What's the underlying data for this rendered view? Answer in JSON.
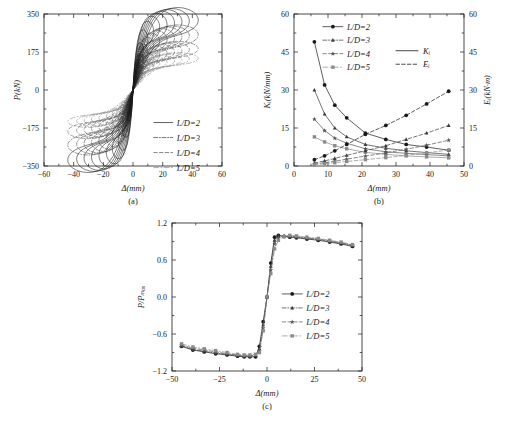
{
  "figure": {
    "background": "#ffffff",
    "ink": "#1a1a1a"
  },
  "subplots": [
    {
      "id": "a",
      "caption": "(a)"
    },
    {
      "id": "b",
      "caption": "(b)"
    },
    {
      "id": "c",
      "caption": "(c)"
    }
  ],
  "series_styles": {
    "ld2": {
      "label": "L/D=2",
      "dash": "none",
      "marker": "circle-filled",
      "color": "#1a1a1a"
    },
    "ld3": {
      "label": "L/D=3",
      "dash": "dashdot",
      "marker": "triangle",
      "color": "#3a3a3a"
    },
    "ld4": {
      "label": "L/D=4",
      "dash": "dashed",
      "marker": "star",
      "color": "#555555"
    },
    "ld5": {
      "label": "L/D=5",
      "dash": "longdash",
      "marker": "square",
      "color": "#8a8a8a"
    }
  },
  "chart_data": [
    {
      "type": "line",
      "id": "a",
      "title": "",
      "xlabel": "Δ(mm)",
      "ylabel": "P(kN)",
      "xlim": [
        -60,
        60
      ],
      "ylim": [
        -350,
        350
      ],
      "xticks": [
        -60,
        -40,
        -20,
        0,
        20,
        40,
        60
      ],
      "yticks": [
        -350,
        -175,
        0,
        175,
        350
      ],
      "grid": false,
      "legend_position": "lower-right",
      "legend": [
        "L/D=2",
        "L/D=3",
        "L/D=4",
        "L/D=5"
      ],
      "description": "Hysteresis (load-displacement) loops; nested cycles of growing amplitude, pinched S-shape.",
      "hysteresis_loops": {
        "ld2": {
          "peak_disp": [
            4,
            7,
            10,
            14,
            18,
            23,
            28,
            33,
            38,
            44
          ],
          "peak_load": [
            120,
            185,
            235,
            268,
            288,
            300,
            308,
            314,
            318,
            322
          ]
        },
        "ld3": {
          "peak_disp": [
            4,
            7,
            10,
            14,
            18,
            23,
            28,
            33,
            38,
            44
          ],
          "peak_load": [
            90,
            140,
            178,
            205,
            222,
            232,
            240,
            246,
            250,
            254
          ]
        },
        "ld4": {
          "peak_disp": [
            4,
            7,
            10,
            14,
            18,
            23,
            28,
            33,
            38,
            44
          ],
          "peak_load": [
            62,
            96,
            124,
            145,
            160,
            170,
            177,
            182,
            186,
            190
          ]
        },
        "ld5": {
          "peak_disp": [
            4,
            7,
            10,
            14,
            18,
            23,
            28,
            33,
            38,
            44
          ],
          "peak_load": [
            45,
            70,
            92,
            108,
            120,
            128,
            134,
            139,
            143,
            146
          ]
        }
      }
    },
    {
      "type": "line",
      "id": "b",
      "title": "",
      "xlabel": "Δ(mm)",
      "ylabel_left": "Kᵢ(kN/mm)",
      "ylabel_right": "Eᵢ(kN·m)",
      "xlim": [
        0,
        50
      ],
      "ylim_left": [
        0,
        60
      ],
      "ylim_right": [
        0,
        60
      ],
      "xticks": [
        0,
        10,
        20,
        30,
        40,
        50
      ],
      "yticks_left": [
        0,
        15,
        30,
        45,
        60
      ],
      "yticks_right": [
        0,
        15,
        30,
        45,
        60
      ],
      "grid": false,
      "legend_position": "upper-left",
      "legend": [
        "L/D=2",
        "L/D=3",
        "L/D=4",
        "L/D=5"
      ],
      "style_legend": [
        {
          "label": "Kᵢ",
          "dash": "solid"
        },
        {
          "label": "Eᵢ",
          "dash": "dashed"
        }
      ],
      "x": [
        6,
        9,
        12,
        15.5,
        21,
        27,
        33,
        39,
        45.5
      ],
      "series": [
        {
          "name": "K_i L/D=2",
          "group": "Ki",
          "style": "ld2",
          "dash": "solid",
          "values": [
            49,
            32,
            24,
            19,
            13,
            10.5,
            8.5,
            7.5,
            6.2
          ]
        },
        {
          "name": "K_i L/D=3",
          "group": "Ki",
          "style": "ld3",
          "dash": "solid",
          "values": [
            30,
            20.5,
            15,
            11.5,
            8.5,
            7,
            6,
            5.3,
            4.6
          ]
        },
        {
          "name": "K_i L/D=4",
          "group": "Ki",
          "style": "ld4",
          "dash": "solid",
          "values": [
            18.5,
            14,
            11,
            9,
            6.8,
            5.6,
            5,
            4.5,
            4
          ]
        },
        {
          "name": "K_i L/D=5",
          "group": "Ki",
          "style": "ld5",
          "dash": "solid",
          "values": [
            11.5,
            9.5,
            8,
            6.8,
            5.4,
            4.6,
            4,
            3.6,
            3.2
          ]
        },
        {
          "name": "E_i L/D=2",
          "group": "Ei",
          "style": "ld2",
          "dash": "dashed",
          "values": [
            2.5,
            4,
            6,
            8.5,
            12.5,
            16,
            20,
            24.5,
            29.5
          ]
        },
        {
          "name": "E_i L/D=3",
          "group": "Ei",
          "style": "ld3",
          "dash": "dashed",
          "values": [
            1.2,
            2,
            3,
            4.2,
            6,
            8,
            10.5,
            13,
            16
          ]
        },
        {
          "name": "E_i L/D=4",
          "group": "Ei",
          "style": "ld4",
          "dash": "dashed",
          "values": [
            0.8,
            1.3,
            1.9,
            2.7,
            3.9,
            5.2,
            6.6,
            8.2,
            10.2
          ]
        },
        {
          "name": "E_i L/D=5",
          "group": "Ei",
          "style": "ld5",
          "dash": "dashed",
          "values": [
            0.5,
            0.9,
            1.3,
            1.8,
            2.5,
            3.3,
            4.2,
            5.2,
            6.3
          ]
        }
      ]
    },
    {
      "type": "line",
      "id": "c",
      "title": "",
      "xlabel": "Δ(mm)",
      "ylabel": "P/Pₘₐₓ",
      "xlim": [
        -50,
        50
      ],
      "ylim": [
        -1.2,
        1.2
      ],
      "xticks": [
        -50,
        -25,
        0,
        25,
        50
      ],
      "yticks": [
        -1.2,
        -0.6,
        0.0,
        0.6,
        1.2
      ],
      "grid": false,
      "legend_position": "center-right",
      "legend": [
        "L/D=2",
        "L/D=3",
        "L/D=4",
        "L/D=5"
      ],
      "description": "Normalized skeleton curves; sharp transition near zero displacement, plateau near ±0.9.",
      "x": [
        -45,
        -39,
        -33,
        -27,
        -21,
        -15.5,
        -12,
        -9,
        -6,
        -4,
        -2,
        0,
        2,
        4,
        6,
        9,
        12,
        15.5,
        21,
        27,
        33,
        39,
        45
      ],
      "series": [
        {
          "name": "L/D=2",
          "style": "ld2",
          "values": [
            -0.8,
            -0.86,
            -0.89,
            -0.92,
            -0.94,
            -0.96,
            -0.97,
            -0.97,
            -0.97,
            -0.8,
            -0.4,
            0.0,
            0.55,
            0.97,
            1.0,
            0.98,
            0.97,
            0.96,
            0.94,
            0.92,
            0.89,
            0.86,
            0.82
          ]
        },
        {
          "name": "L/D=3",
          "style": "ld3",
          "values": [
            -0.79,
            -0.85,
            -0.88,
            -0.91,
            -0.93,
            -0.95,
            -0.96,
            -0.96,
            -0.95,
            -0.84,
            -0.45,
            0.0,
            0.5,
            0.92,
            0.99,
            0.99,
            0.98,
            0.97,
            0.95,
            0.93,
            0.9,
            0.87,
            0.83
          ]
        },
        {
          "name": "L/D=4",
          "style": "ld4",
          "values": [
            -0.78,
            -0.83,
            -0.86,
            -0.89,
            -0.92,
            -0.94,
            -0.95,
            -0.95,
            -0.94,
            -0.88,
            -0.5,
            0.0,
            0.44,
            0.86,
            0.96,
            0.99,
            0.99,
            0.98,
            0.96,
            0.94,
            0.91,
            0.88,
            0.84
          ]
        },
        {
          "name": "L/D=5",
          "style": "ld5",
          "values": [
            -0.76,
            -0.81,
            -0.84,
            -0.87,
            -0.9,
            -0.93,
            -0.94,
            -0.94,
            -0.93,
            -0.9,
            -0.55,
            0.0,
            0.38,
            0.78,
            0.92,
            0.98,
            1.0,
            0.99,
            0.97,
            0.95,
            0.92,
            0.89,
            0.85
          ]
        }
      ]
    }
  ]
}
